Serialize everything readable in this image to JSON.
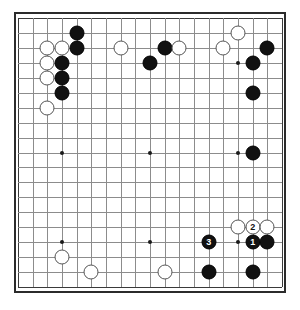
{
  "board": {
    "type": "go-board",
    "size": 19,
    "background_color": "#ffffff",
    "grid_color": "#8c8c8c",
    "border_color": "#2b2b2b",
    "star_points": [
      {
        "col": 4,
        "row": 4
      },
      {
        "col": 10,
        "row": 4
      },
      {
        "col": 16,
        "row": 4
      },
      {
        "col": 4,
        "row": 10
      },
      {
        "col": 10,
        "row": 10
      },
      {
        "col": 16,
        "row": 10
      },
      {
        "col": 4,
        "row": 16
      },
      {
        "col": 10,
        "row": 16
      },
      {
        "col": 16,
        "row": 16
      }
    ],
    "stones": [
      {
        "col": 5,
        "row": 2,
        "color": "black",
        "label": ""
      },
      {
        "col": 5,
        "row": 3,
        "color": "black",
        "label": ""
      },
      {
        "col": 4,
        "row": 4,
        "color": "black",
        "label": ""
      },
      {
        "col": 4,
        "row": 5,
        "color": "black",
        "label": ""
      },
      {
        "col": 4,
        "row": 6,
        "color": "black",
        "label": ""
      },
      {
        "col": 11,
        "row": 3,
        "color": "black",
        "label": ""
      },
      {
        "col": 10,
        "row": 4,
        "color": "black",
        "label": ""
      },
      {
        "col": 18,
        "row": 3,
        "color": "black",
        "label": ""
      },
      {
        "col": 17,
        "row": 4,
        "color": "black",
        "label": ""
      },
      {
        "col": 17,
        "row": 6,
        "color": "black",
        "label": ""
      },
      {
        "col": 17,
        "row": 10,
        "color": "black",
        "label": ""
      },
      {
        "col": 14,
        "row": 16,
        "color": "black",
        "label": "3"
      },
      {
        "col": 17,
        "row": 16,
        "color": "black",
        "label": "1"
      },
      {
        "col": 18,
        "row": 16,
        "color": "black",
        "label": ""
      },
      {
        "col": 14,
        "row": 18,
        "color": "black",
        "label": ""
      },
      {
        "col": 17,
        "row": 18,
        "color": "black",
        "label": ""
      },
      {
        "col": 3,
        "row": 3,
        "color": "white",
        "label": ""
      },
      {
        "col": 4,
        "row": 3,
        "color": "white",
        "label": ""
      },
      {
        "col": 3,
        "row": 4,
        "color": "white",
        "label": ""
      },
      {
        "col": 3,
        "row": 5,
        "color": "white",
        "label": ""
      },
      {
        "col": 3,
        "row": 7,
        "color": "white",
        "label": ""
      },
      {
        "col": 8,
        "row": 3,
        "color": "white",
        "label": ""
      },
      {
        "col": 12,
        "row": 3,
        "color": "white",
        "label": ""
      },
      {
        "col": 15,
        "row": 3,
        "color": "white",
        "label": ""
      },
      {
        "col": 16,
        "row": 2,
        "color": "white",
        "label": ""
      },
      {
        "col": 16,
        "row": 15,
        "color": "white",
        "label": ""
      },
      {
        "col": 17,
        "row": 15,
        "color": "white",
        "label": "2"
      },
      {
        "col": 18,
        "row": 15,
        "color": "white",
        "label": ""
      },
      {
        "col": 4,
        "row": 17,
        "color": "white",
        "label": ""
      },
      {
        "col": 6,
        "row": 18,
        "color": "white",
        "label": ""
      },
      {
        "col": 11,
        "row": 18,
        "color": "white",
        "label": ""
      }
    ],
    "move_labels": [
      "1",
      "2",
      "3"
    ]
  }
}
